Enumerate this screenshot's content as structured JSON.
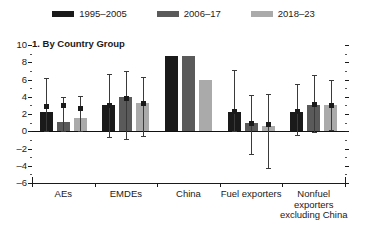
{
  "legend": {
    "items": [
      {
        "label": "1995–2005",
        "color": "#1a1a1a",
        "name": "legend-item-1995-2005"
      },
      {
        "label": "2006–17",
        "color": "#5a5a5a",
        "name": "legend-item-2006-17"
      },
      {
        "label": "2018–23",
        "color": "#aaaaaa",
        "name": "legend-item-2018-23"
      }
    ]
  },
  "chart_data": {
    "type": "bar",
    "title": "1. By Country Group",
    "xlabel": "",
    "ylabel": "",
    "ylim": [
      -6,
      10
    ],
    "yticks": [
      10,
      8,
      6,
      4,
      2,
      0,
      -2,
      -4,
      -6
    ],
    "ytick_labels": [
      "10",
      "8",
      "6",
      "4",
      "2",
      "0",
      "–2",
      "–4",
      "–6"
    ],
    "grid": false,
    "legend_position": "top-center",
    "categories": [
      "AEs",
      "EMDEs",
      "China",
      "Fuel exporters",
      "Nonfuel exporters excluding China"
    ],
    "category_label_lines": [
      [
        "AEs"
      ],
      [
        "EMDEs"
      ],
      [
        "China"
      ],
      [
        "Fuel exporters"
      ],
      [
        "Nonfuel",
        "exporters",
        "excluding China"
      ]
    ],
    "series": [
      {
        "name": "1995–2005",
        "color": "#1a1a1a",
        "values": [
          2.2,
          3.1,
          8.7,
          2.2,
          2.2
        ],
        "error_low": [
          0.0,
          -0.7,
          null,
          0.0,
          -0.4
        ],
        "error_high": [
          6.2,
          6.6,
          null,
          7.1,
          5.5
        ],
        "error_marker": [
          2.9,
          3.1,
          null,
          2.4,
          2.4
        ]
      },
      {
        "name": "2006–17",
        "color": "#5a5a5a",
        "values": [
          1.1,
          4.0,
          8.7,
          1.0,
          3.1
        ],
        "error_low": [
          0.0,
          -0.9,
          null,
          -2.6,
          -0.1
        ],
        "error_high": [
          4.0,
          7.0,
          null,
          4.2,
          6.5
        ],
        "error_marker": [
          3.0,
          3.9,
          null,
          1.0,
          3.2
        ]
      },
      {
        "name": "2018–23",
        "color": "#aaaaaa",
        "values": [
          1.5,
          3.3,
          6.0,
          0.6,
          3.1
        ],
        "error_low": [
          0.0,
          -0.6,
          null,
          -4.3,
          0.1
        ],
        "error_high": [
          4.1,
          6.3,
          null,
          4.3,
          6.0
        ],
        "error_marker": [
          2.7,
          3.3,
          null,
          0.8,
          3.1
        ]
      }
    ]
  }
}
